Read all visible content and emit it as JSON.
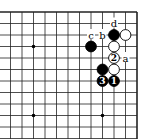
{
  "board": {
    "origin_x": 12,
    "origin_y": 12,
    "spacing": 11.5,
    "cols": 12,
    "rows": 12,
    "line_color": "#222222",
    "edges": [
      "top",
      "right"
    ],
    "star_points": [
      [
        2,
        3
      ],
      [
        2,
        9
      ],
      [
        8,
        9
      ]
    ]
  },
  "stones": [
    {
      "color": "black",
      "col": 9,
      "row": 2,
      "label": ""
    },
    {
      "color": "white",
      "col": 10,
      "row": 2,
      "label": ""
    },
    {
      "color": "black",
      "col": 7,
      "row": 3,
      "label": ""
    },
    {
      "color": "white",
      "col": 9,
      "row": 3,
      "label": ""
    },
    {
      "color": "white",
      "col": 9,
      "row": 4,
      "label": "2"
    },
    {
      "color": "black",
      "col": 8,
      "row": 5,
      "label": ""
    },
    {
      "color": "white",
      "col": 9,
      "row": 5,
      "label": ""
    },
    {
      "color": "black",
      "col": 8,
      "row": 6,
      "label": "3"
    },
    {
      "color": "black",
      "col": 9,
      "row": 6,
      "label": "1"
    }
  ],
  "markers": [
    {
      "text": "d",
      "col": 9,
      "row": 1
    },
    {
      "text": "c",
      "col": 7,
      "row": 2
    },
    {
      "text": "b",
      "col": 8,
      "row": 2
    },
    {
      "text": "a",
      "col": 10,
      "row": 4
    }
  ]
}
